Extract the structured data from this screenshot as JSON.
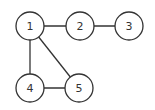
{
  "graph": {
    "nodes": [
      {
        "id": "1",
        "label": "1",
        "x": 30,
        "y": 26
      },
      {
        "id": "2",
        "label": "2",
        "x": 80,
        "y": 26
      },
      {
        "id": "3",
        "label": "3",
        "x": 129,
        "y": 26
      },
      {
        "id": "4",
        "label": "4",
        "x": 30,
        "y": 88
      },
      {
        "id": "5",
        "label": "5",
        "x": 79,
        "y": 88
      }
    ],
    "edges": [
      {
        "from": "1",
        "to": "2"
      },
      {
        "from": "2",
        "to": "3"
      },
      {
        "from": "1",
        "to": "4"
      },
      {
        "from": "1",
        "to": "5"
      },
      {
        "from": "4",
        "to": "5"
      }
    ],
    "node_radius": 14,
    "stroke_color": "#333333"
  }
}
